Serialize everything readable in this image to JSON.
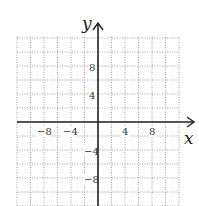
{
  "chart_data": {
    "type": "coordinate-grid",
    "xlabel": "x",
    "ylabel": "y",
    "x_tick_labels": [
      "−8",
      "−4",
      "4",
      "8"
    ],
    "y_tick_labels": [
      "8",
      "4",
      "−4",
      "−8"
    ],
    "grid_step": 2,
    "xlim": [
      -12,
      12
    ],
    "ylim": [
      -12,
      12
    ],
    "grid": true,
    "series": []
  },
  "axes": {
    "x_label": "x",
    "y_label": "y",
    "x_ticks": [
      {
        "label": "−8",
        "x": 43,
        "y": 135
      },
      {
        "label": "−4",
        "x": 69,
        "y": 135
      },
      {
        "label": "4",
        "x": 125,
        "y": 135
      },
      {
        "label": "8",
        "x": 152,
        "y": 135
      }
    ],
    "y_ticks": [
      {
        "label": "8",
        "x": 93,
        "y": 70
      },
      {
        "label": "4",
        "x": 93,
        "y": 98
      },
      {
        "label": "−4",
        "x": 91,
        "y": 154
      },
      {
        "label": "−8",
        "x": 91,
        "y": 182
      }
    ]
  }
}
